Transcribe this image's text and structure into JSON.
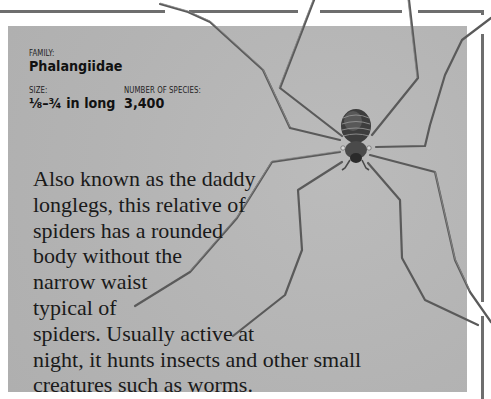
{
  "family": {
    "label": "FAMILY:",
    "value": "Phalangiidae"
  },
  "size": {
    "label": "SIZE:",
    "value": "⅛–¾ in long"
  },
  "species": {
    "label": "NUMBER OF SPECIES:",
    "value": "3,400"
  },
  "description": {
    "lines": [
      "Also known as the daddy",
      "longlegs, this relative of",
      "spiders has a rounded",
      "body without the",
      "narrow waist",
      "typical of",
      "spiders. Usually active at",
      "night, it hunts insects and other small",
      "creatures such as worms."
    ]
  },
  "illustration": {
    "subject": "harvestman-spider",
    "panel_color": "#b5b5b5",
    "frame_color": "#6e6e6e"
  }
}
